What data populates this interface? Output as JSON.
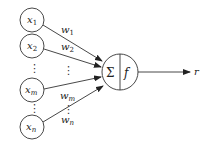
{
  "diagram": {
    "title": "",
    "inputs": [
      {
        "id": "x1",
        "base": "x",
        "sub": "1",
        "cx": 32,
        "cy": 20
      },
      {
        "id": "x2",
        "base": "x",
        "sub": "2",
        "cx": 32,
        "cy": 46
      },
      {
        "id": "xm",
        "base": "x",
        "sub": "m",
        "cx": 32,
        "cy": 90
      },
      {
        "id": "xn",
        "base": "x",
        "sub": "n",
        "cx": 32,
        "cy": 127
      }
    ],
    "weights": [
      {
        "id": "w1",
        "base": "w",
        "sub": "1"
      },
      {
        "id": "w2",
        "base": "w",
        "sub": "2"
      },
      {
        "id": "wm",
        "base": "w",
        "sub": "m"
      },
      {
        "id": "wn",
        "base": "w",
        "sub": "n"
      }
    ],
    "ellipsis": "⋮",
    "neuron": {
      "sum_symbol": "Σ",
      "activation_symbol": "f"
    },
    "output": {
      "label": "r"
    }
  }
}
